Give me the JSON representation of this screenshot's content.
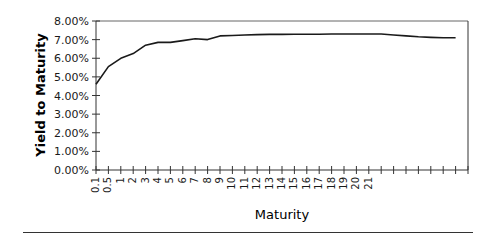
{
  "chart_data": {
    "type": "line",
    "title": "",
    "xlabel": "Maturity",
    "ylabel": "Yield to Maturity",
    "ylim": [
      0,
      0.08
    ],
    "y_ticks": [
      "0.00%",
      "1.00%",
      "2.00%",
      "3.00%",
      "4.00%",
      "5.00%",
      "6.00%",
      "7.00%",
      "8.00%"
    ],
    "categories": [
      "0.1",
      "0.5",
      "1",
      "2",
      "3",
      "4",
      "5",
      "6",
      "7",
      "8",
      "9",
      "10",
      "11",
      "12",
      "13",
      "14",
      "15",
      "16",
      "17",
      "18",
      "19",
      "20",
      "21",
      "",
      "",
      "",
      "",
      "",
      "",
      ""
    ],
    "series": [
      {
        "name": "Yield to Maturity",
        "values": [
          0.046,
          0.0555,
          0.06,
          0.0625,
          0.067,
          0.0685,
          0.0685,
          0.0695,
          0.0705,
          0.07,
          0.072,
          0.0722,
          0.0725,
          0.0727,
          0.0728,
          0.0728,
          0.0729,
          0.0729,
          0.0729,
          0.073,
          0.073,
          0.073,
          0.073,
          0.073,
          0.0725,
          0.072,
          0.0715,
          0.0712,
          0.071,
          0.071
        ]
      }
    ],
    "grid": false,
    "legend": "none"
  },
  "colors": {
    "line": "#1a1a1a",
    "axis": "#333333"
  }
}
